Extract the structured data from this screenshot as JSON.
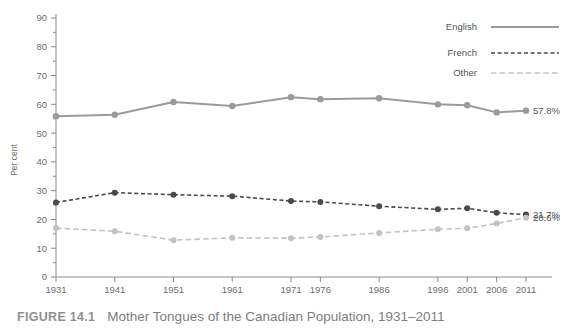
{
  "caption": {
    "tag": "FIGURE 14.1",
    "text": "Mother Tongues of the Canadian Population, 1931–2011"
  },
  "chart_data": {
    "type": "line",
    "title": "Mother Tongues of the Canadian Population, 1931–2011",
    "xlabel": "",
    "ylabel": "Per cent",
    "ylim": [
      0,
      90
    ],
    "ytick_step": 10,
    "yticks": [
      0,
      10,
      20,
      30,
      40,
      50,
      60,
      70,
      80,
      90
    ],
    "minor_ytick_step": 5,
    "grid": false,
    "legend_position": "top-right",
    "categories": [
      "1931",
      "1941",
      "1951",
      "1961",
      "1971",
      "1976",
      "1986",
      "1996",
      "2001",
      "2006",
      "2011"
    ],
    "series": [
      {
        "name": "English",
        "color": "#9a9a9a",
        "style": "solid",
        "values": [
          55.9,
          56.4,
          60.8,
          59.4,
          62.5,
          61.8,
          62.1,
          60.0,
          59.7,
          57.2,
          57.8
        ],
        "end_label": "57.8%"
      },
      {
        "name": "French",
        "color": "#4a4a4a",
        "style": "dotted",
        "values": [
          25.9,
          29.3,
          28.6,
          28.1,
          26.4,
          26.1,
          24.6,
          23.5,
          23.9,
          22.3,
          21.7
        ],
        "end_label": "21.7%"
      },
      {
        "name": "Other",
        "color": "#c2c2c2",
        "style": "dashed",
        "values": [
          17.0,
          15.9,
          12.8,
          13.6,
          13.5,
          13.9,
          15.3,
          16.6,
          16.9,
          18.6,
          20.6
        ],
        "end_label": "20.6%"
      }
    ]
  }
}
